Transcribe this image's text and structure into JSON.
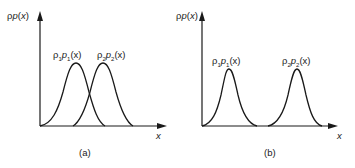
{
  "figure": {
    "panels": [
      {
        "id": "a",
        "caption": "(a)",
        "y_axis_label": "ρp(x)",
        "x_axis_label": "x",
        "curves": [
          {
            "label": "ρ1p1(x)",
            "label_parts": [
              "ρ",
              "1",
              "p",
              "1",
              "(x)"
            ],
            "peak_x": 76,
            "overlap": true
          },
          {
            "label": "ρ2p2(x)",
            "label_parts": [
              "ρ",
              "2",
              "p",
              "2",
              "(x)"
            ],
            "peak_x": 103,
            "overlap": true
          }
        ]
      },
      {
        "id": "b",
        "caption": "(b)",
        "y_axis_label": "ρp(x)",
        "x_axis_label": "x",
        "curves": [
          {
            "label": "ρ1p1(x)",
            "label_parts": [
              "ρ",
              "1",
              "p",
              "1",
              "(x)"
            ],
            "peak_x": 229,
            "overlap": false
          },
          {
            "label": "ρ2p2(x)",
            "label_parts": [
              "ρ",
              "2",
              "p",
              "2",
              "(x)"
            ],
            "peak_x": 297,
            "overlap": false
          }
        ]
      }
    ],
    "colors": {
      "line": "#1a1a1a",
      "background": "#ffffff"
    }
  }
}
